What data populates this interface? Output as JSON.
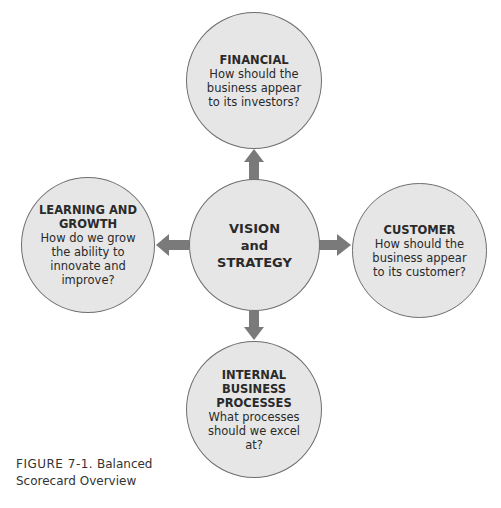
{
  "diagram": {
    "center": {
      "lines": [
        "VISION",
        "and",
        "STRATEGY"
      ]
    },
    "financial": {
      "title_lines": [
        "FINANCIAL"
      ],
      "question_lines": [
        "How should the",
        "business appear",
        "to its investors?"
      ]
    },
    "customer": {
      "title_lines": [
        "CUSTOMER"
      ],
      "question_lines": [
        "How should the",
        "business appear",
        "to its customer?"
      ]
    },
    "learning": {
      "title_lines": [
        "LEARNING AND",
        "GROWTH"
      ],
      "question_lines": [
        "How do we grow",
        "the ability to",
        "innovate and",
        "improve?"
      ]
    },
    "internal": {
      "title_lines": [
        "INTERNAL",
        "BUSINESS",
        "PROCESSES"
      ],
      "question_lines": [
        "What processes",
        "should we excel",
        "at?"
      ]
    },
    "colors": {
      "circle_fill": "#e6e6e6",
      "circle_stroke": "#6e6e6e",
      "arrow": "#7a7a7a"
    }
  },
  "caption": {
    "label": "FIGURE 7-1.",
    "text_line1": "Balanced",
    "text_line2": "Scorecard Overview"
  }
}
